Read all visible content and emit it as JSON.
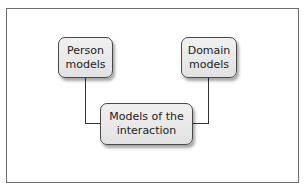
{
  "diagram": {
    "nodes": [
      {
        "id": "person",
        "lines": [
          "Person",
          "models"
        ]
      },
      {
        "id": "domain",
        "lines": [
          "Domain",
          "models"
        ]
      },
      {
        "id": "interaction",
        "lines": [
          "Models of the",
          "interaction"
        ]
      }
    ],
    "edges": [
      {
        "from": "person",
        "to": "interaction"
      },
      {
        "from": "domain",
        "to": "interaction"
      }
    ],
    "colors": {
      "node_fill": "#e6e6e6",
      "node_border": "#4a4a4a",
      "line": "#333333",
      "frame": "#6e6e6e"
    }
  }
}
